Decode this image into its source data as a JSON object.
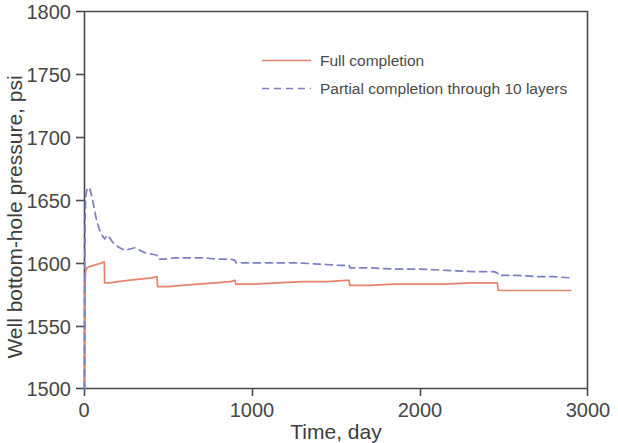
{
  "chart_data": {
    "type": "line",
    "title": "",
    "xlabel": "Time, day",
    "ylabel": "Well bottom-hole pressure, psi",
    "xlim": [
      0,
      3000
    ],
    "ylim": [
      1500,
      1800
    ],
    "xticks": [
      0,
      1000,
      2000,
      3000
    ],
    "yticks": [
      1500,
      1550,
      1600,
      1650,
      1700,
      1750,
      1800
    ],
    "xtick_labels": [
      "0",
      "1000",
      "2000",
      "3000"
    ],
    "ytick_labels": [
      "1500",
      "1550",
      "1600",
      "1650",
      "1700",
      "1750",
      "1800"
    ],
    "grid": false,
    "legend_position": "top-center",
    "series": [
      {
        "name": "Full completion",
        "color": "#e8836b",
        "style": "solid",
        "points": [
          [
            0,
            1500
          ],
          [
            2,
            1572
          ],
          [
            4,
            1588
          ],
          [
            8,
            1594
          ],
          [
            15,
            1596
          ],
          [
            30,
            1597
          ],
          [
            55,
            1598
          ],
          [
            80,
            1599
          ],
          [
            105,
            1600
          ],
          [
            118,
            1601
          ],
          [
            120,
            1584
          ],
          [
            150,
            1584
          ],
          [
            200,
            1585
          ],
          [
            260,
            1586
          ],
          [
            330,
            1587
          ],
          [
            400,
            1588
          ],
          [
            432,
            1589
          ],
          [
            436,
            1581
          ],
          [
            500,
            1581
          ],
          [
            580,
            1582
          ],
          [
            680,
            1583
          ],
          [
            780,
            1584
          ],
          [
            870,
            1585
          ],
          [
            898,
            1586
          ],
          [
            902,
            1583
          ],
          [
            1000,
            1583
          ],
          [
            1150,
            1584
          ],
          [
            1300,
            1585
          ],
          [
            1450,
            1585
          ],
          [
            1560,
            1586
          ],
          [
            1578,
            1586
          ],
          [
            1582,
            1582
          ],
          [
            1700,
            1582
          ],
          [
            1850,
            1583
          ],
          [
            2000,
            1583
          ],
          [
            2150,
            1583
          ],
          [
            2300,
            1584
          ],
          [
            2440,
            1584
          ],
          [
            2462,
            1584
          ],
          [
            2468,
            1578
          ],
          [
            2560,
            1578
          ],
          [
            2700,
            1578
          ],
          [
            2800,
            1578
          ],
          [
            2900,
            1578
          ]
        ]
      },
      {
        "name": "Partial completion through 10 layers",
        "color": "#7b7fc4",
        "style": "dashed",
        "points": [
          [
            0,
            1500
          ],
          [
            2,
            1600
          ],
          [
            4,
            1634
          ],
          [
            7,
            1650
          ],
          [
            12,
            1657
          ],
          [
            20,
            1660
          ],
          [
            32,
            1659
          ],
          [
            45,
            1652
          ],
          [
            58,
            1643
          ],
          [
            72,
            1634
          ],
          [
            88,
            1627
          ],
          [
            105,
            1622
          ],
          [
            120,
            1619
          ],
          [
            135,
            1622
          ],
          [
            150,
            1620
          ],
          [
            165,
            1617
          ],
          [
            185,
            1614
          ],
          [
            210,
            1612
          ],
          [
            240,
            1610
          ],
          [
            270,
            1611
          ],
          [
            300,
            1612
          ],
          [
            330,
            1610
          ],
          [
            360,
            1608
          ],
          [
            400,
            1607
          ],
          [
            432,
            1606
          ],
          [
            438,
            1603
          ],
          [
            480,
            1603
          ],
          [
            540,
            1604
          ],
          [
            620,
            1604
          ],
          [
            700,
            1604
          ],
          [
            790,
            1603
          ],
          [
            870,
            1603
          ],
          [
            898,
            1602
          ],
          [
            904,
            1600
          ],
          [
            1000,
            1600
          ],
          [
            1120,
            1600
          ],
          [
            1260,
            1600
          ],
          [
            1400,
            1599
          ],
          [
            1520,
            1598
          ],
          [
            1578,
            1598
          ],
          [
            1584,
            1596
          ],
          [
            1700,
            1596
          ],
          [
            1850,
            1595
          ],
          [
            2000,
            1595
          ],
          [
            2160,
            1594
          ],
          [
            2320,
            1593
          ],
          [
            2440,
            1593
          ],
          [
            2462,
            1592
          ],
          [
            2470,
            1590
          ],
          [
            2580,
            1590
          ],
          [
            2700,
            1589
          ],
          [
            2800,
            1589
          ],
          [
            2900,
            1588
          ]
        ]
      }
    ]
  },
  "legend": {
    "entries": [
      {
        "label": "Full completion"
      },
      {
        "label": "Partial completion through 10 layers"
      }
    ]
  },
  "colors": {
    "series_full": "#e8836b",
    "series_partial": "#7b7fc4",
    "axis": "#4a4a4a",
    "background": "#ffffff"
  }
}
